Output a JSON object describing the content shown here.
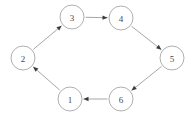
{
  "diagram": {
    "type": "directed-cycle-graph",
    "background_color": "#ffffff",
    "node_stroke_color": "#9a9a9a",
    "edge_color": "#8f8f8f",
    "arrowhead_color": "#3a3a3a",
    "label_color": "#4a4a4a",
    "node_radius": 12,
    "nodes": [
      {
        "id": "1",
        "label": "1",
        "cx": 70,
        "cy": 99
      },
      {
        "id": "2",
        "label": "2",
        "cx": 23,
        "cy": 58
      },
      {
        "id": "3",
        "label": "3",
        "cx": 72,
        "cy": 17
      },
      {
        "id": "4",
        "label": "4",
        "cx": 121,
        "cy": 18
      },
      {
        "id": "5",
        "label": "5",
        "cx": 172,
        "cy": 58
      },
      {
        "id": "6",
        "label": "6",
        "cx": 121,
        "cy": 99
      }
    ],
    "edges": [
      {
        "id": "edge-1-2",
        "from": "1",
        "to": "2",
        "label": "1 to 2"
      },
      {
        "id": "edge-2-3",
        "from": "2",
        "to": "3",
        "label": "2 to 3"
      },
      {
        "id": "edge-3-4",
        "from": "3",
        "to": "4",
        "label": "3 to 4"
      },
      {
        "id": "edge-4-5",
        "from": "4",
        "to": "5",
        "label": "4 to 5"
      },
      {
        "id": "edge-5-6",
        "from": "5",
        "to": "6",
        "label": "5 to 6"
      },
      {
        "id": "edge-6-1",
        "from": "6",
        "to": "1",
        "label": "6 to 1"
      }
    ]
  }
}
